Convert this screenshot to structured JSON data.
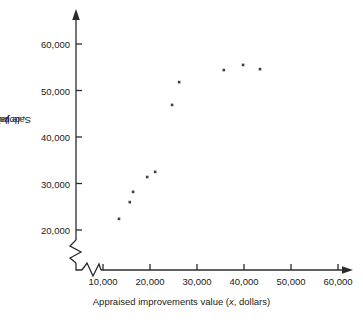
{
  "chart_data": {
    "type": "scatter",
    "title": "",
    "xlabel": "Appraised improvements value (x, dollars)",
    "ylabel": "Sale price (y, dollars)",
    "xlabel_parts": {
      "prefix": "Appraised improvements value (",
      "symbol": "x",
      "suffix": ", dollars)"
    },
    "ylabel_parts": {
      "prefix": "Sale price (",
      "symbol": "y",
      "suffix": ", dollars)"
    },
    "xlim": [
      5000,
      63000
    ],
    "ylim": [
      15000,
      64000
    ],
    "xticks": [
      10000,
      20000,
      30000,
      40000,
      50000,
      60000
    ],
    "yticks": [
      20000,
      30000,
      40000,
      50000,
      60000
    ],
    "xtick_labels": [
      "10,000",
      "20,000",
      "30,000",
      "40,000",
      "50,000",
      "60,000"
    ],
    "ytick_labels": [
      "20,000",
      "30,000",
      "40,000",
      "50,000",
      "60,000"
    ],
    "grid": false,
    "legend": "none",
    "x_axis_break": true,
    "y_axis_break": true,
    "marker_color": "#3f3f44",
    "axis_color": "#2b2b2b",
    "points": [
      {
        "x": 13400,
        "y": 22400
      },
      {
        "x": 15700,
        "y": 26000
      },
      {
        "x": 16400,
        "y": 28200
      },
      {
        "x": 19400,
        "y": 31400
      },
      {
        "x": 21100,
        "y": 32500
      },
      {
        "x": 24700,
        "y": 46900
      },
      {
        "x": 26200,
        "y": 51800
      },
      {
        "x": 35700,
        "y": 54400
      },
      {
        "x": 39800,
        "y": 55500
      },
      {
        "x": 43400,
        "y": 54600
      }
    ]
  }
}
